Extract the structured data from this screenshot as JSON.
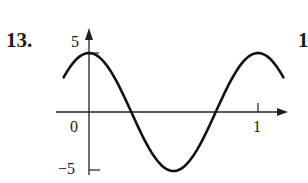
{
  "problem": {
    "number": "13.",
    "next_number_partial": "1"
  },
  "chart_data": {
    "type": "line",
    "title": "",
    "xlabel": "",
    "ylabel": "",
    "function": "y = 5cos(2πx)",
    "x_tick_labels": [
      "0",
      "1"
    ],
    "y_tick_labels": [
      "5",
      "-5"
    ],
    "xlim": [
      -0.15,
      1.15
    ],
    "ylim": [
      -5,
      5
    ],
    "grid": false,
    "legend": null,
    "series": [
      {
        "name": "curve",
        "x": [
          -0.15,
          0,
          0.25,
          0.5,
          0.75,
          1,
          1.15
        ],
        "y": [
          2.94,
          5,
          0,
          -5,
          0,
          5,
          2.94
        ]
      }
    ]
  },
  "labels": {
    "y_top": "5",
    "y_bottom": "−5",
    "origin": "0",
    "x_one": "1"
  }
}
